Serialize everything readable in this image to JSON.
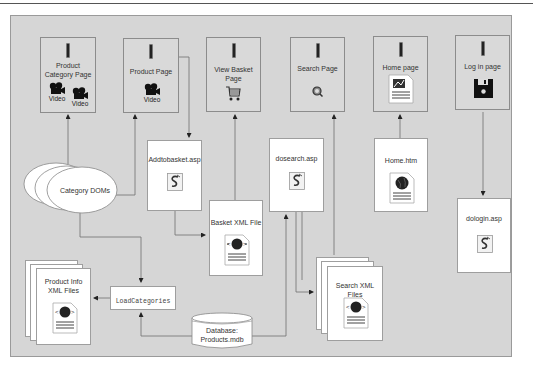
{
  "diagram": {
    "type": "architecture-flow",
    "nodes": {
      "product_category_page": {
        "label": "Product Category Page",
        "label_line1": "Product",
        "label_line2": "Category Page",
        "media": [
          "Video",
          "Video"
        ]
      },
      "product_page": {
        "label": "Product Page",
        "media": [
          "Video"
        ]
      },
      "view_basket_page": {
        "label": "View Basket Page",
        "label_line1": "View Basket",
        "label_line2": "Page",
        "icon": "shopping-cart-icon"
      },
      "search_page": {
        "label": "Search Page",
        "icon": "magnifier-icon"
      },
      "home_page": {
        "label": "Home page",
        "icon": "html-document-icon"
      },
      "login_page": {
        "label": "Log in page",
        "icon": "floppy-disk-icon"
      },
      "addtobasket": {
        "label": "Addtobasket.asp",
        "icon": "asp-script-icon"
      },
      "basket_xml": {
        "label": "Basket XML File",
        "icon": "xml-document-icon"
      },
      "dosearch": {
        "label": "dosearch.asp",
        "icon": "asp-script-icon"
      },
      "home_htm": {
        "label": "Home.htm",
        "icon": "web-document-icon"
      },
      "dologin": {
        "label": "dologin.asp",
        "icon": "asp-script-icon"
      },
      "category_doms": {
        "label": "Category DOMs"
      },
      "product_info_xml": {
        "label": "Product Info XML Files",
        "label_line1": "Product Info",
        "label_line2": "XML Files",
        "icon": "xml-document-icon"
      },
      "load_categories": {
        "label": "LoadCategories"
      },
      "database": {
        "label": "Database: Products.mdb",
        "label_line1": "Database:",
        "label_line2": "Products.mdb"
      },
      "search_xml": {
        "label": "Search XML Files",
        "icon": "xml-document-icon"
      }
    },
    "edges": [
      {
        "from": "Category DOMs",
        "to": "Product Category Page"
      },
      {
        "from": "Category DOMs",
        "to": "Product Page"
      },
      {
        "from": "Category DOMs",
        "to": "LoadCategories"
      },
      {
        "from": "Product Page",
        "to": "Addtobasket.asp"
      },
      {
        "from": "Addtobasket.asp",
        "to": "Basket XML File"
      },
      {
        "from": "Basket XML File",
        "to": "View Basket Page"
      },
      {
        "from": "Database: Products.mdb",
        "to": "LoadCategories"
      },
      {
        "from": "LoadCategories",
        "to": "Product Info XML Files"
      },
      {
        "from": "Database: Products.mdb",
        "to": "dosearch.asp"
      },
      {
        "from": "dosearch.asp",
        "to": "Search XML Files"
      },
      {
        "from": "Search XML Files",
        "to": "Search Page"
      },
      {
        "from": "Home.htm",
        "to": "Home page"
      },
      {
        "from": "Log in page",
        "to": "dologin.asp"
      },
      {
        "from": "Search XML Files",
        "to": "Database: Products.mdb"
      }
    ]
  },
  "colors": {
    "panel_bg": "#d6d6d6",
    "page_box_bg": "#d9d9d9",
    "file_box_bg": "#ffffff",
    "line": "#6b6b6b"
  }
}
